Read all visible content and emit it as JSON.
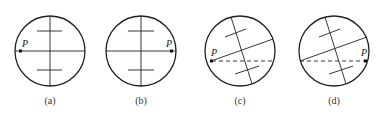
{
  "figure": {
    "panels": [
      {
        "id": "a",
        "caption": "(a)",
        "point_label": "P",
        "center": [
          50,
          51
        ],
        "radius": 35,
        "description": "Vertical crosshair with horizontal line through center, two short horizontal ticks above and below; point P on left edge"
      },
      {
        "id": "b",
        "caption": "(b)",
        "point_label": "P",
        "center": [
          141,
          51
        ],
        "radius": 35,
        "description": "Same reticle as (a); point P on right edge"
      },
      {
        "id": "c",
        "caption": "(c)",
        "point_label": "P",
        "center": [
          240,
          51
        ],
        "radius": 35,
        "description": "Reticle rotated; dashed horizontal line through P at left edge"
      },
      {
        "id": "d",
        "caption": "(d)",
        "point_label": "P",
        "center": [
          334,
          51
        ],
        "radius": 35,
        "description": "Reticle rotated; dashed horizontal line ending at P on right edge"
      }
    ]
  }
}
